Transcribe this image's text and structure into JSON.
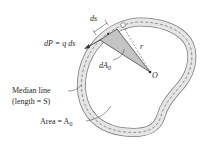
{
  "diagram": {
    "type": "thin-walled tube cross-section (torsion)",
    "labels": {
      "force": "dP = q ds",
      "ds": "ds",
      "r": "r",
      "dA0": "dA",
      "dA0_sub": "0",
      "origin": "O",
      "median_line": "Median line",
      "length": "(length = S)",
      "area": "Area = A",
      "area_sub": "0"
    },
    "colors": {
      "tube_fill": "#e6e6e6",
      "tube_edge": "#7a7a7a",
      "wedge_fill": "#c4c4c4",
      "ink": "#2a2a2a"
    }
  }
}
